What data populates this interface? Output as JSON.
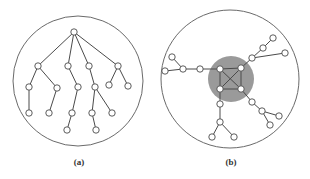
{
  "figure": {
    "panels": [
      {
        "id": "a",
        "label": "(a)",
        "description": "rooted tree inside a circle",
        "circle": {
          "cx": 78,
          "cy": 81,
          "r": 65
        },
        "nodes": [
          [
            74,
            32
          ],
          [
            38,
            66
          ],
          [
            68,
            66
          ],
          [
            89,
            66
          ],
          [
            118,
            66
          ],
          [
            29,
            87
          ],
          [
            57,
            88
          ],
          [
            78,
            87
          ],
          [
            95,
            87
          ],
          [
            109,
            85
          ],
          [
            128,
            86
          ],
          [
            29,
            113
          ],
          [
            49,
            113
          ],
          [
            72,
            113
          ],
          [
            92,
            113
          ],
          [
            112,
            113
          ],
          [
            67,
            130
          ],
          [
            96,
            130
          ]
        ],
        "edges": [
          [
            0,
            1
          ],
          [
            0,
            2
          ],
          [
            0,
            3
          ],
          [
            0,
            4
          ],
          [
            1,
            5
          ],
          [
            1,
            6
          ],
          [
            2,
            7
          ],
          [
            3,
            8
          ],
          [
            4,
            9
          ],
          [
            4,
            10
          ],
          [
            5,
            11
          ],
          [
            6,
            12
          ],
          [
            7,
            13
          ],
          [
            8,
            14
          ],
          [
            8,
            15
          ],
          [
            13,
            16
          ],
          [
            14,
            17
          ]
        ]
      },
      {
        "id": "b",
        "label": "(b)",
        "description": "graph with shaded complete core K4 and attached trees inside a circle",
        "circle": {
          "cx": 230,
          "cy": 79,
          "r": 69
        },
        "core": {
          "cx": 231,
          "cy": 79,
          "r": 23,
          "color": "#9a9a9a"
        },
        "nodes": [
          [
            220,
            69
          ],
          [
            241,
            68
          ],
          [
            220,
            89
          ],
          [
            241,
            89
          ],
          [
            200,
            69
          ],
          [
            183,
            69
          ],
          [
            172,
            57
          ],
          [
            165,
            71
          ],
          [
            252,
            58
          ],
          [
            263,
            48
          ],
          [
            273,
            38
          ],
          [
            285,
            53
          ],
          [
            252,
            102
          ],
          [
            262,
            111
          ],
          [
            279,
            116
          ],
          [
            270,
            125
          ],
          [
            220,
            104
          ],
          [
            220,
            122
          ],
          [
            212,
            137
          ],
          [
            234,
            137
          ]
        ],
        "edges": [
          [
            0,
            1
          ],
          [
            1,
            3
          ],
          [
            3,
            2
          ],
          [
            2,
            0
          ],
          [
            0,
            3
          ],
          [
            1,
            2
          ],
          [
            0,
            4
          ],
          [
            4,
            5
          ],
          [
            5,
            6
          ],
          [
            5,
            7
          ],
          [
            1,
            8
          ],
          [
            8,
            9
          ],
          [
            9,
            10
          ],
          [
            8,
            11
          ],
          [
            3,
            12
          ],
          [
            12,
            13
          ],
          [
            13,
            14
          ],
          [
            13,
            15
          ],
          [
            2,
            16
          ],
          [
            16,
            17
          ],
          [
            17,
            18
          ],
          [
            17,
            19
          ]
        ]
      }
    ],
    "node_radius": 3.2
  }
}
